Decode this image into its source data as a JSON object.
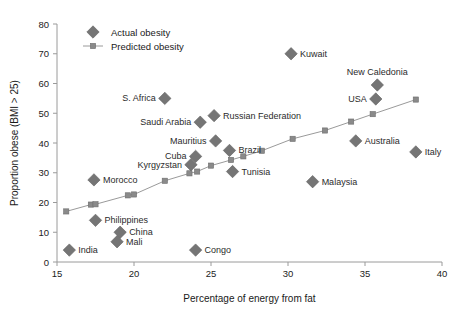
{
  "chart_data": {
    "type": "scatter",
    "title": "",
    "xlabel": "Percentage of energy from fat",
    "ylabel": "Proportion obese (BMI > 25)",
    "xlim": [
      15,
      40
    ],
    "ylim": [
      0,
      80
    ],
    "xticks": [
      15,
      20,
      25,
      30,
      35,
      40
    ],
    "yticks": [
      0,
      10,
      20,
      30,
      40,
      50,
      60,
      70,
      80
    ],
    "grid": false,
    "legend_position": "top-left",
    "legend": [
      {
        "name": "Actual obesity",
        "marker": "diamond",
        "color": "#7d7d7d"
      },
      {
        "name": "Predicted obesity",
        "marker": "square-line",
        "color": "#8a8a8a"
      }
    ],
    "series": [
      {
        "name": "Actual obesity",
        "marker": "diamond",
        "color": "#757575",
        "points": [
          {
            "label": "India",
            "x": 15.8,
            "y": 4.0,
            "label_pos": "right"
          },
          {
            "label": "Morocco",
            "x": 17.4,
            "y": 27.6,
            "label_pos": "right"
          },
          {
            "label": "Philippines",
            "x": 17.5,
            "y": 14.0,
            "label_pos": "right"
          },
          {
            "label": "China",
            "x": 19.1,
            "y": 10.0,
            "label_pos": "right"
          },
          {
            "label": "Mali",
            "x": 18.9,
            "y": 6.8,
            "label_pos": "right"
          },
          {
            "label": "S. Africa",
            "x": 22.0,
            "y": 55.0,
            "label_pos": "left"
          },
          {
            "label": "Congo",
            "x": 24.0,
            "y": 4.0,
            "label_pos": "right"
          },
          {
            "label": "Kyrgyzstan",
            "x": 23.7,
            "y": 32.7,
            "label_pos": "left"
          },
          {
            "label": "Cuba",
            "x": 24.0,
            "y": 35.5,
            "label_pos": "left"
          },
          {
            "label": "Saudi Arabia",
            "x": 24.3,
            "y": 47.0,
            "label_pos": "left"
          },
          {
            "label": "Mauritius",
            "x": 25.3,
            "y": 40.7,
            "label_pos": "left"
          },
          {
            "label": "Russian Federation",
            "x": 25.2,
            "y": 49.2,
            "label_pos": "right"
          },
          {
            "label": "Brazil",
            "x": 26.2,
            "y": 37.5,
            "label_pos": "right"
          },
          {
            "label": "Tunisia",
            "x": 26.4,
            "y": 30.4,
            "label_pos": "right"
          },
          {
            "label": "Kuwait",
            "x": 30.2,
            "y": 70.0,
            "label_pos": "right"
          },
          {
            "label": "Malaysia",
            "x": 31.6,
            "y": 27.0,
            "label_pos": "right"
          },
          {
            "label": "Australia",
            "x": 34.4,
            "y": 40.7,
            "label_pos": "right"
          },
          {
            "label": "USA",
            "x": 35.7,
            "y": 54.8,
            "label_pos": "left"
          },
          {
            "label": "New Caledonia",
            "x": 35.8,
            "y": 59.5,
            "label_pos": "above"
          },
          {
            "label": "Italy",
            "x": 38.3,
            "y": 37.0,
            "label_pos": "right"
          }
        ]
      },
      {
        "name": "Predicted obesity",
        "marker": "square",
        "color": "#8a8a8a",
        "line": true,
        "points": [
          {
            "x": 15.6,
            "y": 17.0
          },
          {
            "x": 17.2,
            "y": 19.3
          },
          {
            "x": 17.5,
            "y": 19.4
          },
          {
            "x": 19.6,
            "y": 22.4
          },
          {
            "x": 20.0,
            "y": 22.7
          },
          {
            "x": 22.0,
            "y": 27.3
          },
          {
            "x": 23.6,
            "y": 29.8
          },
          {
            "x": 24.1,
            "y": 30.4
          },
          {
            "x": 25.0,
            "y": 32.4
          },
          {
            "x": 26.3,
            "y": 34.3
          },
          {
            "x": 27.1,
            "y": 35.5
          },
          {
            "x": 28.3,
            "y": 37.4
          },
          {
            "x": 30.3,
            "y": 41.4
          },
          {
            "x": 32.4,
            "y": 44.2
          },
          {
            "x": 34.1,
            "y": 47.2
          },
          {
            "x": 35.5,
            "y": 49.7
          },
          {
            "x": 38.3,
            "y": 54.6
          }
        ]
      }
    ]
  }
}
